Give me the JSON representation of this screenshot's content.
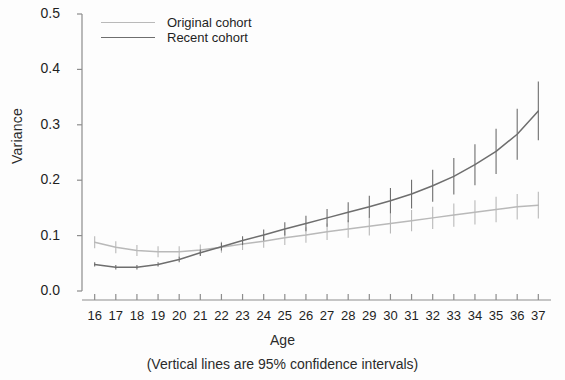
{
  "chart_data": {
    "type": "line",
    "title": "",
    "xlabel": "Age",
    "ylabel": "Variance",
    "caption": "(Vertical lines are 95% confidence intervals)",
    "grid": false,
    "legend_position": "top-left",
    "xlim": [
      15.4,
      37.6
    ],
    "ylim": [
      0.0,
      0.5
    ],
    "yticks": [
      "0.0",
      "0.1",
      "0.2",
      "0.3",
      "0.4",
      "0.5"
    ],
    "ytick_values": [
      0.0,
      0.1,
      0.2,
      0.3,
      0.4,
      0.5
    ],
    "x": [
      16,
      17,
      18,
      19,
      20,
      21,
      22,
      23,
      24,
      25,
      26,
      27,
      28,
      29,
      30,
      31,
      32,
      33,
      34,
      35,
      36,
      37
    ],
    "xtick_labels": [
      "16",
      "17",
      "18",
      "19",
      "20",
      "21",
      "22",
      "23",
      "24",
      "25",
      "26",
      "27",
      "28",
      "29",
      "30",
      "31",
      "32",
      "33",
      "34",
      "35",
      "36",
      "37"
    ],
    "series": [
      {
        "name": "Original cohort",
        "color": "#b9b9b9",
        "values": [
          0.088,
          0.079,
          0.073,
          0.071,
          0.071,
          0.074,
          0.079,
          0.085,
          0.09,
          0.096,
          0.101,
          0.107,
          0.112,
          0.117,
          0.122,
          0.127,
          0.132,
          0.137,
          0.142,
          0.147,
          0.152,
          0.155
        ],
        "ci_lower": [
          0.077,
          0.068,
          0.063,
          0.061,
          0.061,
          0.064,
          0.069,
          0.074,
          0.078,
          0.083,
          0.087,
          0.092,
          0.096,
          0.1,
          0.104,
          0.108,
          0.112,
          0.116,
          0.12,
          0.124,
          0.129,
          0.131
        ],
        "ci_upper": [
          0.099,
          0.09,
          0.083,
          0.081,
          0.081,
          0.084,
          0.089,
          0.096,
          0.102,
          0.109,
          0.115,
          0.122,
          0.128,
          0.134,
          0.14,
          0.146,
          0.152,
          0.158,
          0.164,
          0.17,
          0.175,
          0.179
        ]
      },
      {
        "name": "Recent cohort",
        "color": "#6e6e6e",
        "values": [
          0.048,
          0.043,
          0.043,
          0.048,
          0.057,
          0.069,
          0.08,
          0.091,
          0.101,
          0.112,
          0.122,
          0.132,
          0.142,
          0.152,
          0.163,
          0.175,
          0.19,
          0.207,
          0.228,
          0.252,
          0.283,
          0.325
        ],
        "ci_lower": [
          0.044,
          0.039,
          0.039,
          0.044,
          0.052,
          0.063,
          0.073,
          0.083,
          0.091,
          0.1,
          0.108,
          0.116,
          0.124,
          0.132,
          0.14,
          0.149,
          0.161,
          0.174,
          0.191,
          0.211,
          0.237,
          0.272
        ],
        "ci_upper": [
          0.052,
          0.047,
          0.047,
          0.052,
          0.062,
          0.075,
          0.087,
          0.099,
          0.111,
          0.124,
          0.136,
          0.148,
          0.16,
          0.172,
          0.186,
          0.201,
          0.219,
          0.24,
          0.265,
          0.293,
          0.329,
          0.378
        ]
      }
    ]
  }
}
